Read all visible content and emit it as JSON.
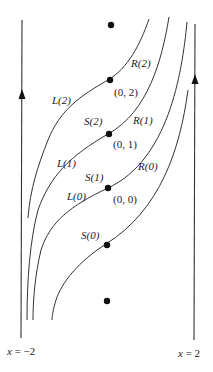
{
  "diagram": {
    "title": "",
    "boundaries": {
      "left": {
        "label": "x = −2",
        "var": "x",
        "eq": " = −2"
      },
      "right": {
        "label": "x = 2",
        "var": "x",
        "eq": " = 2"
      }
    },
    "points": [
      {
        "id": "top",
        "label": ""
      },
      {
        "id": "p02",
        "label": "(0, 2)"
      },
      {
        "id": "p01",
        "label": "(0, 1)"
      },
      {
        "id": "p00",
        "label": "(0, 0)"
      },
      {
        "id": "s0",
        "label": ""
      },
      {
        "id": "bottom",
        "label": ""
      }
    ],
    "curve_labels": {
      "R2": "R(2)",
      "L2": "L(2)",
      "S2": "S(2)",
      "R1": "R(1)",
      "L1": "L(1)",
      "S1": "S(1)",
      "R0": "R(0)",
      "L0": "L(0)",
      "S0": "S(0)"
    },
    "colors": {
      "line": "#333333",
      "dot": "#111111",
      "background": "#ffffff"
    }
  }
}
